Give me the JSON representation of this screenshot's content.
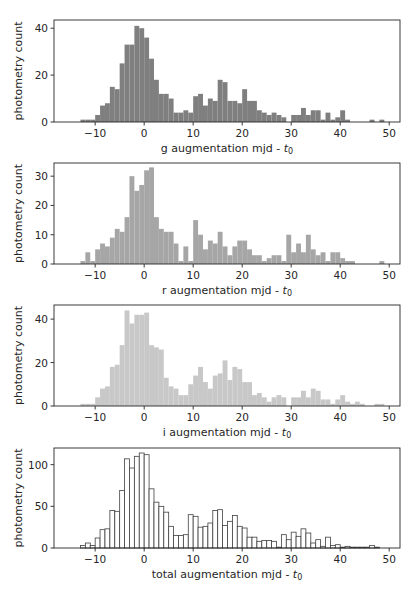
{
  "chart_data": [
    {
      "type": "bar",
      "band": "g",
      "title": "",
      "xlabel": "g augmentation mjd - t0",
      "ylabel": "photometry count",
      "xlim": [
        -18.4,
        52.2
      ],
      "ylim": [
        0,
        43.5
      ],
      "xticks": [
        -10,
        0,
        10,
        20,
        30,
        40,
        50
      ],
      "xtick_labels": [
        "−10",
        "0",
        "10",
        "20",
        "30",
        "40",
        "50"
      ],
      "yticks": [
        0,
        20,
        40
      ],
      "ytick_labels": [
        "0",
        "20",
        "40"
      ],
      "bin_start": -13,
      "bin_width": 1,
      "values": [
        1,
        1,
        1,
        3,
        7,
        8,
        15,
        14,
        25,
        33,
        33,
        41,
        40,
        36,
        27,
        18,
        12,
        12,
        10,
        4,
        4,
        5,
        4,
        11,
        12,
        7,
        10,
        9,
        18,
        17,
        9,
        9,
        8,
        14,
        9,
        9,
        5,
        4,
        3,
        4,
        3,
        2,
        0,
        3,
        3,
        6,
        3,
        5,
        5,
        1,
        4,
        1,
        2,
        5,
        1,
        0,
        0,
        0,
        0,
        1,
        0,
        1
      ],
      "color": "#7f7f7f",
      "style": "filled",
      "grid": false
    },
    {
      "type": "bar",
      "band": "r",
      "title": "",
      "xlabel": "r augmentation mjd - t0",
      "ylabel": "photometry count",
      "xlim": [
        -18.4,
        52.2
      ],
      "ylim": [
        0,
        34.5
      ],
      "xticks": [
        -10,
        0,
        10,
        20,
        30,
        40,
        50
      ],
      "xtick_labels": [
        "−10",
        "0",
        "10",
        "20",
        "30",
        "40",
        "50"
      ],
      "yticks": [
        0,
        10,
        20,
        30
      ],
      "ytick_labels": [
        "0",
        "10",
        "20",
        "30"
      ],
      "bin_start": -13,
      "bin_width": 1,
      "values": [
        1,
        4,
        1,
        5,
        7,
        6,
        9,
        12,
        11,
        16,
        30,
        25,
        27,
        32,
        33,
        16,
        12,
        11,
        11,
        7,
        1,
        6,
        1,
        15,
        10,
        5,
        8,
        7,
        11,
        6,
        3,
        6,
        8,
        8,
        5,
        3,
        3,
        1,
        2,
        3,
        3,
        1,
        10,
        4,
        7,
        4,
        10,
        5,
        3,
        4,
        1,
        4,
        4,
        2,
        1,
        1,
        0,
        0,
        0,
        0,
        0,
        1
      ],
      "color": "#a6a6a6",
      "style": "filled",
      "grid": false
    },
    {
      "type": "bar",
      "band": "i",
      "title": "",
      "xlabel": "i augmentation mjd - t0",
      "ylabel": "photometry count",
      "xlim": [
        -18.4,
        52.2
      ],
      "ylim": [
        0,
        46.5
      ],
      "xticks": [
        -10,
        0,
        10,
        20,
        30,
        40,
        50
      ],
      "xtick_labels": [
        "−10",
        "0",
        "10",
        "20",
        "30",
        "40",
        "50"
      ],
      "yticks": [
        0,
        20,
        40
      ],
      "ytick_labels": [
        "0",
        "20",
        "40"
      ],
      "bin_start": -13,
      "bin_width": 1,
      "values": [
        1,
        1,
        1,
        4,
        8,
        9,
        18,
        19,
        28,
        44,
        38,
        42,
        42,
        43,
        28,
        27,
        26,
        13,
        9,
        8,
        5,
        5,
        10,
        14,
        18,
        11,
        8,
        14,
        15,
        21,
        12,
        18,
        17,
        11,
        11,
        5,
        6,
        4,
        2,
        4,
        5,
        4,
        0,
        4,
        4,
        7,
        4,
        8,
        7,
        3,
        3,
        1,
        3,
        5,
        2,
        1,
        2,
        1,
        0,
        0,
        1,
        1
      ],
      "color": "#c8c8c8",
      "style": "filled",
      "grid": false
    },
    {
      "type": "bar",
      "band": "total",
      "title": "",
      "xlabel": "total augmentation mjd - t0",
      "ylabel": "photometry count",
      "xlim": [
        -18.4,
        52.2
      ],
      "ylim": [
        0,
        120
      ],
      "xticks": [
        -10,
        0,
        10,
        20,
        30,
        40,
        50
      ],
      "xtick_labels": [
        "−10",
        "0",
        "10",
        "20",
        "30",
        "40",
        "50"
      ],
      "yticks": [
        0,
        50,
        100
      ],
      "ytick_labels": [
        "0",
        "50",
        "100"
      ],
      "bin_start": -13,
      "bin_width": 1,
      "values": [
        3,
        6,
        3,
        12,
        22,
        23,
        45,
        44,
        69,
        107,
        96,
        110,
        114,
        112,
        71,
        55,
        50,
        43,
        26,
        15,
        15,
        16,
        40,
        38,
        25,
        26,
        30,
        45,
        46,
        27,
        32,
        39,
        26,
        24,
        13,
        13,
        8,
        9,
        9,
        8,
        1,
        16,
        10,
        19,
        14,
        23,
        18,
        6,
        10,
        2,
        13,
        3,
        4,
        1,
        2,
        1,
        1,
        1,
        1,
        3,
        1,
        0
      ],
      "color": "#ffffff",
      "edgecolor": "#404040",
      "style": "outline",
      "grid": false
    }
  ]
}
